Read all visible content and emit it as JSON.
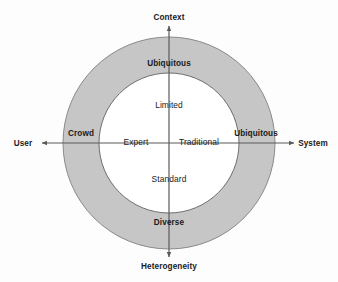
{
  "figure": {
    "type": "concentric-ring-quadrant-diagram",
    "background_color": "#fdfdfd"
  },
  "colors": {
    "ring_fill": "#c6c6c6",
    "ring_stroke": "#8a8a8a",
    "core_fill": "#ffffff",
    "core_stroke": "#6e6e6e",
    "axis_line": "#5a5a5a",
    "text": "#1a1a1a"
  },
  "axes": {
    "vertical": {
      "top_label": "Context",
      "bottom_label": "Heterogeneity"
    },
    "horizontal": {
      "left_label": "User",
      "right_label": "System"
    }
  },
  "outer_ring": {
    "name": "outer-ring",
    "labels": {
      "top": "Ubiquitous",
      "right": "Ubiquitous",
      "bottom": "Diverse",
      "left": "Crowd"
    }
  },
  "inner_circle": {
    "name": "inner-circle",
    "labels": {
      "top": "Limited",
      "right": "Traditional",
      "bottom": "Standard",
      "left": "Expert"
    }
  },
  "icons": {
    "arrow_up": "arrow-up-icon",
    "arrow_down": "arrow-down-icon",
    "arrow_left": "arrow-left-icon",
    "arrow_right": "arrow-right-icon"
  }
}
